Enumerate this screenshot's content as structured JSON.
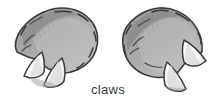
{
  "figure": {
    "caption": "claws",
    "style": "hand-drawn line illustration with gray shading",
    "background_color": "#ffffff",
    "width": 216,
    "height": 107
  },
  "palette": {
    "outline": "#3b3b3b",
    "pad_dark": "#8d8d8d",
    "pad_mid": "#a6a6a6",
    "pad_light": "#bdbdbd",
    "pad_highlight": "#cfcfcf",
    "claw_white": "#fbfbfb",
    "claw_shadow": "#d8d8d8",
    "caption_color": "#3a3a3a"
  },
  "elements": {
    "left_claw_label": "left claw",
    "right_claw_label": "right claw",
    "left_nail_count": 2,
    "right_nail_count": 2,
    "texture_marks": "short dashed strokes along pad edges"
  }
}
